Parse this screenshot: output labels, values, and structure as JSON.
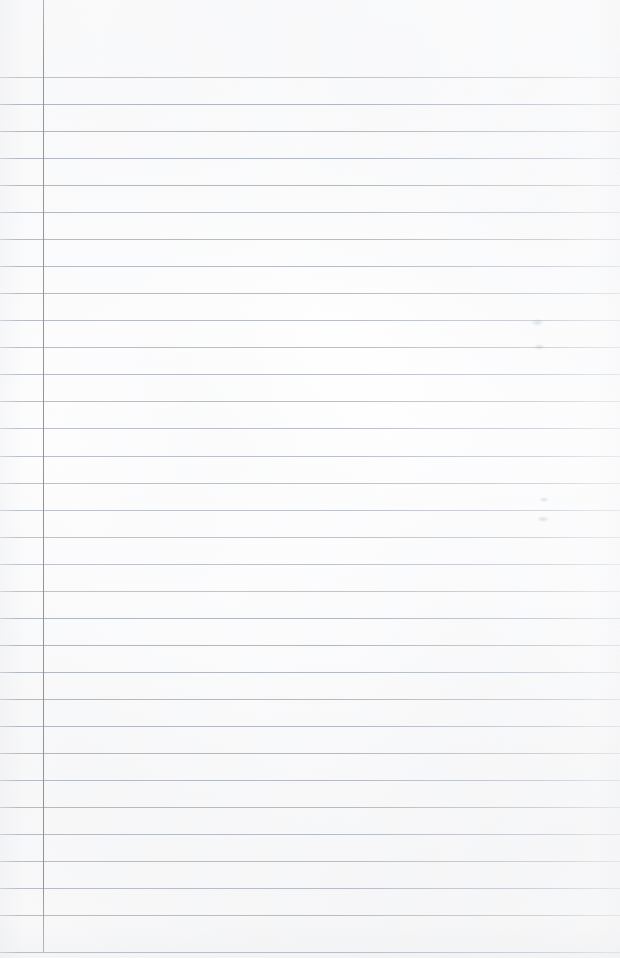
{
  "document": {
    "kind": "blank-ruled-notebook-page",
    "title": "Blank Ruled Notebook Page",
    "width": 620,
    "height": 958,
    "has_text_content": false,
    "written_content": [],
    "page_number": "",
    "header_text": "",
    "footer_text": ""
  },
  "paper": {
    "background_color": "#fdfdfe",
    "edge_shadow_color": "#aab0b8",
    "texture": "faint mottled scan grain"
  },
  "ruling": {
    "style": "wide-ruled",
    "line_color": "#aab0b9",
    "line_thickness_px": 1,
    "line_spacing_px": 27,
    "first_line_y": 77,
    "last_line_y": 952,
    "line_count": 33,
    "line_start_x": 0,
    "line_end_x": 620,
    "line_y_positions": [
      77,
      104,
      131,
      158,
      185,
      212,
      239,
      266,
      293,
      320,
      347,
      374,
      401,
      428,
      456,
      483,
      510,
      537,
      564,
      591,
      618,
      645,
      672,
      699,
      726,
      753,
      780,
      807,
      834,
      861,
      888,
      915,
      952
    ]
  },
  "margin_rule": {
    "orientation": "vertical",
    "color": "#8c929c",
    "thickness_px": 1,
    "x": 43,
    "y_start": 0,
    "y_end": 952
  },
  "artifacts": {
    "label": "faint scan smudges",
    "marks": [
      {
        "x": 531,
        "y": 319,
        "w": 13,
        "h": 7
      },
      {
        "x": 534,
        "y": 344,
        "w": 11,
        "h": 6
      },
      {
        "x": 539,
        "y": 497,
        "w": 10,
        "h": 5
      },
      {
        "x": 537,
        "y": 516,
        "w": 12,
        "h": 6
      }
    ]
  }
}
